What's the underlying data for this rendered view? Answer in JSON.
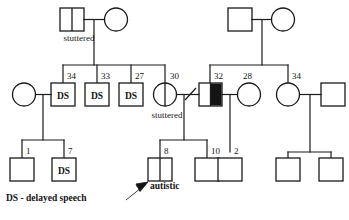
{
  "figure": {
    "type": "pedigree-chart",
    "title": "",
    "background_color": "#ffffff",
    "line_color": "#1a1a1a",
    "fill_affected_color": "#141414"
  },
  "legend": {
    "ds_key": "DS  - delayed speech",
    "ds_abbrev": "DS"
  },
  "proband": {
    "label": "autistic",
    "arrow": "proband-arrow"
  },
  "symbol_labels": {
    "ds": "DS"
  },
  "annotations": {
    "stuttered_gen1": "stuttered",
    "stuttered_gen2": "stuttered"
  },
  "generation1": {
    "left_couple": {
      "male": {
        "shape": "square",
        "note": "stuttered",
        "split": true,
        "affected": false
      },
      "female": {
        "shape": "circle",
        "affected": false
      }
    },
    "right_couple": {
      "male": {
        "shape": "square",
        "affected": false
      },
      "female": {
        "shape": "circle",
        "affected": false
      }
    }
  },
  "generation2": {
    "left_sibship": [
      {
        "age": "34",
        "shape": "square",
        "status": "DS"
      },
      {
        "age": "33",
        "shape": "square",
        "status": "DS"
      },
      {
        "age": "27",
        "shape": "square",
        "status": "DS"
      },
      {
        "age": "30",
        "shape": "circle",
        "status": "stuttered",
        "split": true
      }
    ],
    "left_spouse": {
      "shape": "circle",
      "affected": false
    },
    "right_sibship": [
      {
        "age": "32",
        "shape": "square",
        "status": "affected-half-filled"
      },
      {
        "age": "28",
        "shape": "circle",
        "status": ""
      },
      {
        "age": "34",
        "shape": "circle",
        "status": ""
      }
    ],
    "right_spouses": [
      {
        "shape": "circle",
        "affected": false
      },
      {
        "shape": "square",
        "affected": false
      }
    ],
    "relationship_marks": {
      "separation_slash": "divorced-or-separated"
    }
  },
  "generation3": {
    "leftmost_sibship": [
      {
        "age": "1",
        "shape": "square",
        "status": ""
      },
      {
        "age": "7",
        "shape": "square",
        "status": "DS"
      }
    ],
    "center_sibship": [
      {
        "age": "8",
        "shape": "square",
        "status": "autistic",
        "split": true,
        "proband": true
      },
      {
        "age": "10",
        "shape": "square",
        "status": ""
      }
    ],
    "center_right_sibship": [
      {
        "age": "2",
        "shape": "square",
        "status": ""
      }
    ],
    "right_sibship": [
      {
        "age": "",
        "shape": "square",
        "status": ""
      },
      {
        "age": "",
        "shape": "square",
        "status": ""
      }
    ]
  },
  "ages": {
    "g2_a": "34",
    "g2_b": "33",
    "g2_c": "27",
    "g2_d": "30",
    "g2_e": "32",
    "g2_f": "28",
    "g2_g": "34",
    "g3_a": "1",
    "g3_b": "7",
    "g3_c": "8",
    "g3_d": "10",
    "g3_e": "2"
  }
}
